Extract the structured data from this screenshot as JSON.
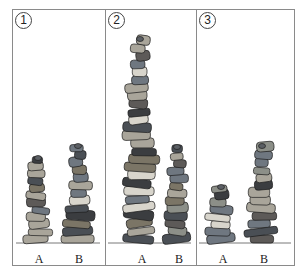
{
  "figure": {
    "colors": {
      "frame": "#8a8a8a",
      "ink": "#222222",
      "stone_palette": [
        "#6f7780",
        "#4a4f55",
        "#8c8f88",
        "#a9a59a",
        "#5d5a58",
        "#3b3d40",
        "#7b7566",
        "#d8d5cc"
      ]
    },
    "ground_y": 243,
    "panels": [
      {
        "number": "1",
        "x": 12,
        "width": 92,
        "stacks": [
          {
            "label": "A",
            "cx": 38,
            "top": 156,
            "width": 26,
            "stones": 12
          },
          {
            "label": "B",
            "cx": 78,
            "top": 144,
            "width": 28,
            "stones": 13
          }
        ]
      },
      {
        "number": "2",
        "x": 104,
        "width": 91,
        "stacks": [
          {
            "label": "A",
            "cx": 140,
            "top": 37,
            "width": 34,
            "stones": 26
          },
          {
            "label": "B",
            "cx": 177,
            "top": 145,
            "width": 24,
            "stones": 13
          }
        ]
      },
      {
        "number": "3",
        "x": 195,
        "width": 100,
        "stacks": [
          {
            "label": "A",
            "cx": 221,
            "top": 185,
            "width": 28,
            "stones": 8
          },
          {
            "label": "B",
            "cx": 262,
            "top": 144,
            "width": 30,
            "stones": 13
          }
        ]
      }
    ]
  }
}
